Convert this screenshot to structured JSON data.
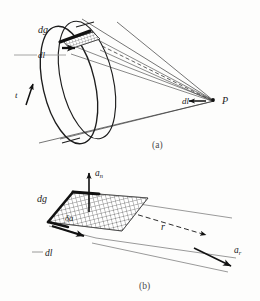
{
  "figure": {
    "background_color": "#fdfdfc",
    "ink_color": "#1a1a1a"
  },
  "panel_a": {
    "caption": "(a)",
    "labels": {
      "dg": "dg",
      "dl_ring": "dl",
      "t": "t",
      "dl_point": "dl",
      "point_p": "P"
    },
    "dash_prefix": "—"
  },
  "panel_b": {
    "caption": "(b)",
    "labels": {
      "a_n_base": "a",
      "a_n_sub": "n",
      "dg": "dg",
      "delta_a": "δa",
      "dl": "dl",
      "r": "r",
      "a_r_base": "a",
      "a_r_sub": "r"
    },
    "dash_prefix": "—"
  }
}
